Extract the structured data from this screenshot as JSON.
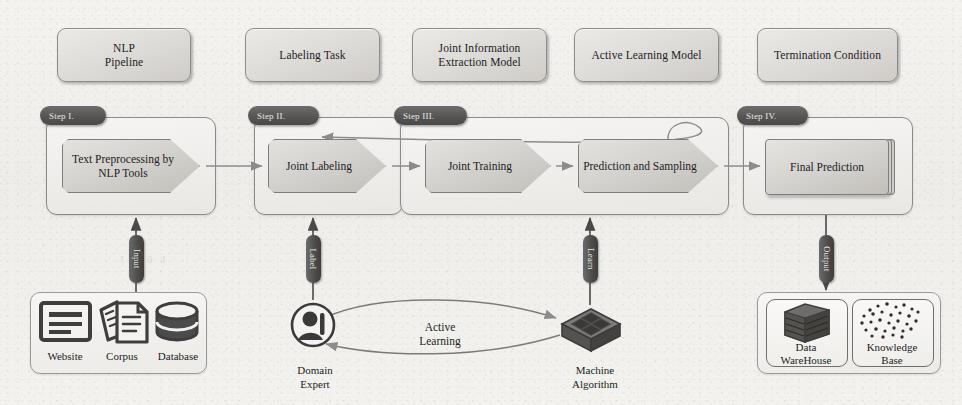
{
  "figure": {
    "background_color": "#f2f1ee",
    "accent_dark": "#4f4e4d",
    "line_color": "#6f6f6f"
  },
  "concepts": [
    {
      "id": "nlp-pipeline",
      "label": "NLP\nPipeline"
    },
    {
      "id": "labeling-task",
      "label": "Labeling Task"
    },
    {
      "id": "joint-ie-model",
      "label": "Joint Information\nExtraction Model"
    },
    {
      "id": "active-learning-model",
      "label": "Active Learning Model"
    },
    {
      "id": "termination-condition",
      "label": "Termination Condition"
    }
  ],
  "steps": [
    {
      "id": "step-1",
      "tag": "Step I.",
      "nodes": [
        {
          "id": "text-preprocessing",
          "label": "Text Preprocessing by\nNLP Tools",
          "shape": "chevron"
        }
      ]
    },
    {
      "id": "step-2",
      "tag": "Step II.",
      "nodes": [
        {
          "id": "joint-labeling",
          "label": "Joint Labeling",
          "shape": "chevron"
        }
      ]
    },
    {
      "id": "step-3",
      "tag": "Step III.",
      "nodes": [
        {
          "id": "joint-training",
          "label": "Joint Training",
          "shape": "chevron"
        },
        {
          "id": "prediction-sampling",
          "label": "Prediction and Sampling",
          "shape": "chevron"
        }
      ]
    },
    {
      "id": "step-4",
      "tag": "Step IV.",
      "nodes": [
        {
          "id": "final-prediction",
          "label": "Final Prediction",
          "shape": "stack"
        }
      ]
    }
  ],
  "edge_labels": {
    "input": "Input",
    "label": "Label",
    "learn": "Learn",
    "output": "Output",
    "active_learning": "Active\nLearning"
  },
  "sources": {
    "items": [
      {
        "id": "website",
        "label": "Website",
        "icon": "browser-window-icon"
      },
      {
        "id": "corpus",
        "label": "Corpus",
        "icon": "document-stack-icon"
      },
      {
        "id": "database",
        "label": "Database",
        "icon": "database-cylinder-icon"
      }
    ]
  },
  "actors": [
    {
      "id": "domain-expert",
      "label": "Domain\nExpert",
      "icon": "person-in-circle-icon"
    },
    {
      "id": "machine-algorithm",
      "label": "Machine\nAlgorithm",
      "icon": "isometric-grid-block-icon"
    }
  ],
  "outputs": {
    "items": [
      {
        "id": "data-warehouse",
        "label": "Data\nWareHouse",
        "icon": "server-stack-icon"
      },
      {
        "id": "knowledge-base",
        "label": "Knowledge\nBase",
        "icon": "scatter-dots-icon"
      }
    ]
  }
}
